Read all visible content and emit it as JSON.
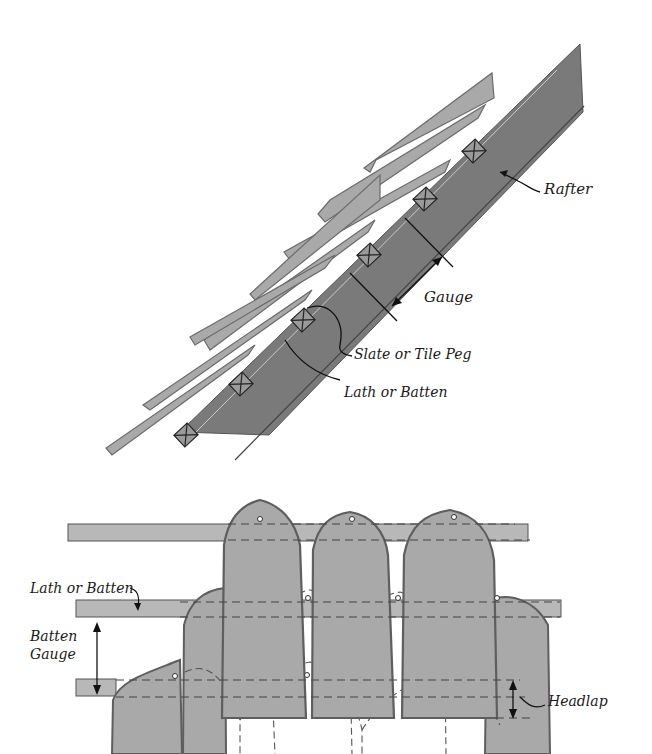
{
  "figure": {
    "top_view": {
      "title": "Roof section (side view)",
      "labels": {
        "rafter": "Rafter",
        "gauge": "Gauge",
        "peg": "Slate or Tile Peg",
        "lath": "Lath or Batten"
      }
    },
    "bottom_view": {
      "title": "Slate courses (front view)",
      "labels": {
        "lath": "Lath or Batten",
        "batten_gauge_line1": "Batten",
        "batten_gauge_line2": "Gauge",
        "headlap": "Headlap"
      }
    },
    "colors": {
      "rafter": "#7a7a7a",
      "slate": "#a9a9a9",
      "slate_outline": "#5e5e5e",
      "batten": "#b4b4b4",
      "ink": "#1a1a1a",
      "background": "#ffffff"
    }
  }
}
